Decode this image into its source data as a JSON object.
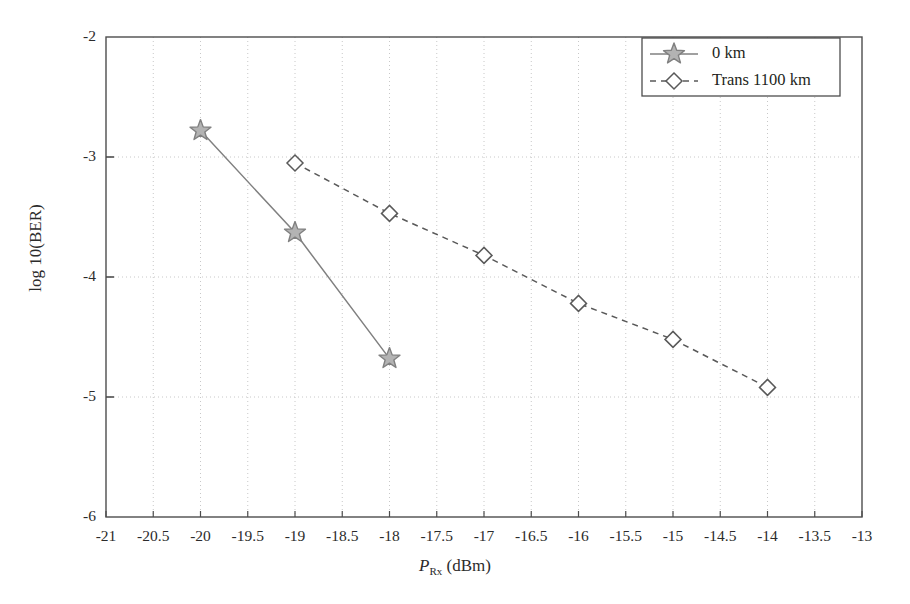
{
  "chart_data": {
    "type": "line",
    "title": "",
    "xlabel": "P_Rx (dBm)",
    "xlabel_parts": {
      "symbol": "P",
      "subscript": "Rx",
      "unit": "(dBm)"
    },
    "ylabel": "log 10(BER)",
    "xlim": [
      -21,
      -13
    ],
    "ylim": [
      -6,
      -2
    ],
    "xtick_step": 0.5,
    "ytick_step": 1,
    "grid": true,
    "grid_style": "dotted",
    "legend_position": "top-right",
    "xticks": [
      "-21",
      "-20.5",
      "-20",
      "-19.5",
      "-19",
      "-18.5",
      "-18",
      "-17.5",
      "-17",
      "-16.5",
      "-16",
      "-15.5",
      "-15",
      "-14.5",
      "-14",
      "-13.5",
      "-13"
    ],
    "xtick_values": [
      -21,
      -20.5,
      -20,
      -19.5,
      -19,
      -18.5,
      -18,
      -17.5,
      -17,
      -16.5,
      -16,
      -15.5,
      -15,
      -14.5,
      -14,
      -13.5,
      -13
    ],
    "yticks": [
      "-2",
      "-3",
      "-4",
      "-5",
      "-6"
    ],
    "ytick_values": [
      -2,
      -3,
      -4,
      -5,
      -6
    ],
    "series": [
      {
        "name": "0 km",
        "marker": "star",
        "linestyle": "solid",
        "color": "#808080",
        "marker_fill": "#b3b3b3",
        "x": [
          -20,
          -19,
          -18
        ],
        "y": [
          -2.78,
          -3.63,
          -4.68
        ]
      },
      {
        "name": "Trans 1100 km",
        "marker": "diamond",
        "linestyle": "dashed",
        "color": "#595959",
        "marker_fill": "#ffffff",
        "x": [
          -19,
          -18,
          -17,
          -16,
          -15,
          -14
        ],
        "y": [
          -3.05,
          -3.47,
          -3.82,
          -4.22,
          -4.52,
          -4.92
        ]
      }
    ]
  },
  "legend": {
    "entries": [
      {
        "label": "0 km"
      },
      {
        "label": "Trans 1100 km"
      }
    ]
  },
  "colors": {
    "axis": "#4d4d4d",
    "grid": "#c8c8c8",
    "series_0": "#808080",
    "series_1": "#595959",
    "text": "#231f20"
  }
}
